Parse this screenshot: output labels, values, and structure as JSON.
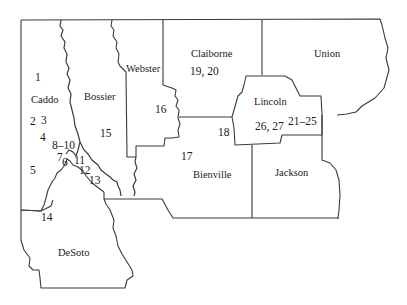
{
  "map": {
    "region": "Northwest Louisiana parishes",
    "parishes": [
      {
        "name": "Caddo",
        "x": 31,
        "y": 95
      },
      {
        "name": "Bossier",
        "x": 83,
        "y": 92
      },
      {
        "name": "Webster",
        "x": 126,
        "y": 64
      },
      {
        "name": "Claiborne",
        "x": 191,
        "y": 49
      },
      {
        "name": "Union",
        "x": 314,
        "y": 50
      },
      {
        "name": "Lincoln",
        "x": 254,
        "y": 97
      },
      {
        "name": "Bienville",
        "x": 193,
        "y": 170
      },
      {
        "name": "Jackson",
        "x": 275,
        "y": 168
      },
      {
        "name": "DeSoto",
        "x": 58,
        "y": 248
      }
    ],
    "locations": [
      {
        "label": "1",
        "x": 36,
        "y": 73
      },
      {
        "label": "2",
        "x": 30,
        "y": 117
      },
      {
        "label": "3",
        "x": 41,
        "y": 116
      },
      {
        "label": "4",
        "x": 41,
        "y": 133
      },
      {
        "label": "8–10",
        "x": 52,
        "y": 140
      },
      {
        "label": "7",
        "x": 58,
        "y": 154
      },
      {
        "label": "6",
        "x": 63,
        "y": 158
      },
      {
        "label": "11",
        "x": 75,
        "y": 156
      },
      {
        "label": "12",
        "x": 80,
        "y": 166
      },
      {
        "label": "13",
        "x": 90,
        "y": 176
      },
      {
        "label": "5",
        "x": 30,
        "y": 166
      },
      {
        "label": "14",
        "x": 42,
        "y": 212
      },
      {
        "label": "15",
        "x": 100,
        "y": 129
      },
      {
        "label": "16",
        "x": 155,
        "y": 105
      },
      {
        "label": "17",
        "x": 181,
        "y": 152
      },
      {
        "label": "18",
        "x": 218,
        "y": 128
      },
      {
        "label": "19, 20",
        "x": 190,
        "y": 66
      },
      {
        "label": "26, 27",
        "x": 255,
        "y": 121
      },
      {
        "label": "21–25",
        "x": 288,
        "y": 117
      }
    ]
  }
}
